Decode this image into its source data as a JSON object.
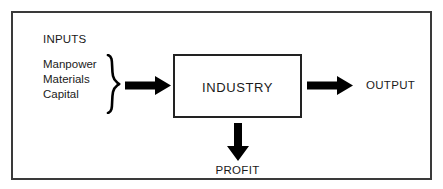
{
  "diagram": {
    "title_text": "INPUTS",
    "inputs": [
      {
        "label": "Manpower"
      },
      {
        "label": "Materials"
      },
      {
        "label": "Capital"
      }
    ],
    "brace_icon": "curly-brace-right-icon",
    "process": {
      "label": "INDUSTRY"
    },
    "output": {
      "label": "OUTPUT"
    },
    "profit": {
      "label": "PROFIT"
    },
    "arrows": {
      "inputs_to_industry": "arrow-right-icon",
      "industry_to_output": "arrow-right-icon",
      "industry_to_profit": "arrow-down-icon"
    },
    "colors": {
      "frame_border": "#3a3a3a",
      "box_border": "#222222",
      "arrow_fill": "#000000",
      "text": "#1a1a1a",
      "background": "#ffffff"
    }
  }
}
